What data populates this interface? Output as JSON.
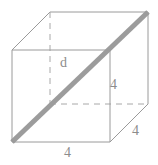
{
  "figure": {
    "shape": "cube",
    "stroke_color": "#9a9a9a",
    "dashed_color": "#a8a8a8",
    "diagonal_color": "#9c9c9c",
    "label_color": "#8c8c8c",
    "background": "#ffffff",
    "solid_stroke_width": 1,
    "dashed_stroke_width": 1,
    "diagonal_stroke_width": 5,
    "dash_pattern": "6,5"
  },
  "labels": {
    "diagonal": "d",
    "edge_right": "4",
    "edge_depth": "4",
    "edge_bottom": "4"
  },
  "vertices": {
    "front_top_left": [
      12,
      50
    ],
    "front_top_right": [
      110,
      50
    ],
    "front_bottom_right": [
      110,
      142
    ],
    "front_bottom_left": [
      12,
      142
    ],
    "back_top_left": [
      50,
      12
    ],
    "back_top_right": [
      148,
      12
    ],
    "back_bottom_right": [
      148,
      104
    ],
    "back_bottom_left": [
      50,
      104
    ]
  },
  "edges": {
    "solid": [
      "front_top_left-front_top_right",
      "front_top_right-front_bottom_right",
      "front_bottom_right-front_bottom_left",
      "front_bottom_left-front_top_left",
      "front_top_left-back_top_left",
      "front_top_right-back_top_right",
      "front_bottom_right-back_bottom_right",
      "back_top_left-back_top_right",
      "back_top_right-back_bottom_right"
    ],
    "dashed": [
      "back_top_left-back_bottom_left",
      "back_bottom_left-back_bottom_right"
    ],
    "diagonal": "front_bottom_left-back_top_right"
  }
}
